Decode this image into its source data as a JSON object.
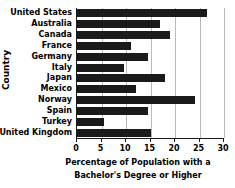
{
  "chart_data": {
    "type": "bar",
    "orientation": "horizontal",
    "title": "",
    "xlabel": "Percentage of Population with a Bachelor's Degree or Higher",
    "xlabel_line1": "Percentage of Population with a",
    "xlabel_line2": "Bachelor's Degree or Higher",
    "ylabel": "Country",
    "categories": [
      "United States",
      "Australia",
      "Canada",
      "France",
      "Germany",
      "Italy",
      "Japan",
      "Mexico",
      "Norway",
      "Spain",
      "Turkey",
      "United Kingdom"
    ],
    "values": [
      26.5,
      17,
      19,
      11,
      14.5,
      9.5,
      18,
      12,
      24,
      14.5,
      5.5,
      15
    ],
    "xlim": [
      0,
      30
    ],
    "xticks": [
      0,
      5,
      10,
      15,
      20,
      25,
      30
    ],
    "xtick_labels": [
      "0",
      "5",
      "10",
      "15",
      "20",
      "25",
      "30"
    ],
    "grid": "vertical",
    "legend": null,
    "bar_color": "#1a1a1a",
    "gridline_color": "#b9b9b9",
    "axis_color": "#1a1a1a",
    "background_color": "#ffffff"
  }
}
